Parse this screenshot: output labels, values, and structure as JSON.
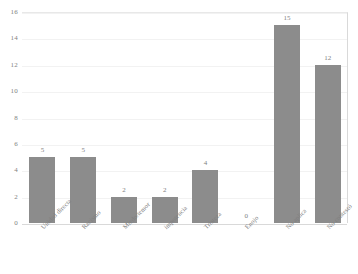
{
  "chart_data": {
    "type": "bar",
    "title": "",
    "subtitle": "",
    "xlabel": "",
    "ylabel": "",
    "categories": [
      "Unidad directa",
      "Racismo",
      "Miedo/temor",
      "impotencia",
      "Tristeza",
      "Enojo",
      "No aplica",
      "No contestó"
    ],
    "values": [
      5,
      5,
      2,
      2,
      4,
      0,
      15,
      12
    ],
    "value_labels": [
      "5",
      "5",
      "2",
      "2",
      "4",
      "0",
      "15",
      "12"
    ],
    "ylim": [
      0,
      16
    ],
    "ytick_labels": [
      "0",
      "2",
      "4",
      "6",
      "8",
      "10",
      "12",
      "14",
      "16"
    ],
    "ytick_values": [
      0,
      2,
      4,
      6,
      8,
      10,
      12,
      14,
      16
    ],
    "grid": true,
    "legend": "none",
    "bar_color": "#8c8c8c",
    "grid_color": "#f2f2f2",
    "axis_color": "#d9d9d9",
    "text_color": "#7f7f7f"
  }
}
